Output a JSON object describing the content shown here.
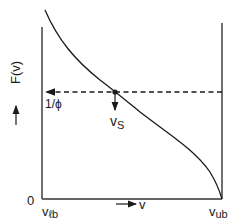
{
  "diagram": {
    "y_axis": {
      "label": "F(v)",
      "arrow": "up-arrow"
    },
    "x_axis": {
      "label": "v",
      "arrow": "right-arrow"
    },
    "labels": {
      "origin": "0",
      "lower_bound": "v",
      "lower_bound_sub": "ℓb",
      "upper_bound": "v",
      "upper_bound_sub": "ub",
      "threshold": "1/ϕ",
      "solution": "v",
      "solution_sub": "S"
    },
    "curve": {
      "description": "Monotonically decreasing curve from top-left near v_lb to zero at v_ub, crossing 1/ϕ at v_S",
      "points": [
        [
          45,
          10
        ],
        [
          60,
          40
        ],
        [
          80,
          62
        ],
        [
          100,
          80
        ],
        [
          115,
          92
        ],
        [
          140,
          112
        ],
        [
          170,
          132
        ],
        [
          195,
          155
        ],
        [
          210,
          175
        ],
        [
          222,
          199
        ]
      ]
    },
    "intersection": {
      "x": 115,
      "y": 92
    },
    "colors": {
      "line": "#1a1a1a",
      "background": "#ffffff"
    }
  }
}
